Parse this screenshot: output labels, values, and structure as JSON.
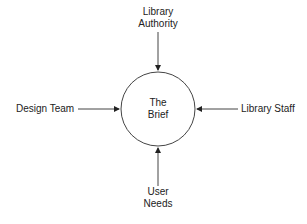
{
  "diagram": {
    "type": "context-diagram",
    "center": {
      "line1": "The",
      "line2": "Brief"
    },
    "nodes": {
      "top": {
        "line1": "Library",
        "line2": "Authority"
      },
      "left": {
        "label": "Design Team"
      },
      "right": {
        "label": "Library Staff"
      },
      "bottom": {
        "line1": "User",
        "line2": "Needs"
      }
    },
    "edges": [
      {
        "from": "Library Authority",
        "to": "The Brief"
      },
      {
        "from": "Design Team",
        "to": "The Brief"
      },
      {
        "from": "Library Staff",
        "to": "The Brief"
      },
      {
        "from": "User Needs",
        "to": "The Brief"
      }
    ],
    "colors": {
      "stroke": "#333333",
      "text": "#222222",
      "background": "#ffffff"
    }
  }
}
